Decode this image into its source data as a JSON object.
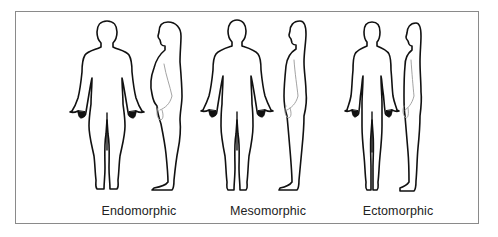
{
  "diagram": {
    "title": "",
    "body_types": [
      {
        "id": "endomorphic",
        "label": "Endomorphic",
        "views": [
          "front",
          "side"
        ]
      },
      {
        "id": "mesomorphic",
        "label": "Mesomorphic",
        "views": [
          "front",
          "side"
        ]
      },
      {
        "id": "ectomorphic",
        "label": "Ectomorphic",
        "views": [
          "front",
          "side"
        ]
      }
    ]
  },
  "colors": {
    "frame": "#8a8a8a",
    "outline": "#111111",
    "background": "#ffffff"
  }
}
